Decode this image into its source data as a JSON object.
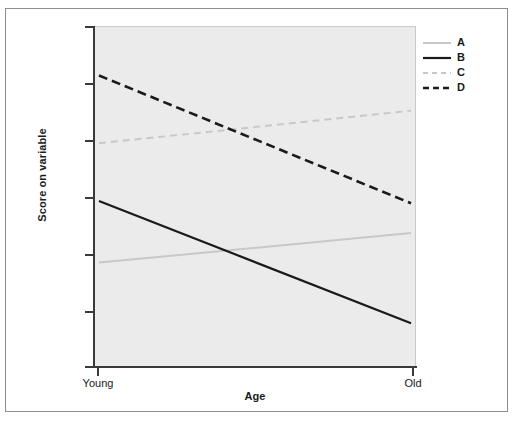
{
  "chart_data": {
    "type": "line",
    "title": "",
    "xlabel": "Age",
    "ylabel": "Score on variable",
    "x": [
      "Young",
      "Old"
    ],
    "xtick_labels": [
      "Young",
      "Old"
    ],
    "ytick_labels": [
      "",
      "",
      "",
      "",
      "",
      "",
      ""
    ],
    "grid": false,
    "legend_position": "top-right",
    "xlim": [
      0,
      1
    ],
    "ylim": [
      0,
      1
    ],
    "y_tick_count": 7,
    "series": [
      {
        "name": "A",
        "style": "solid",
        "color": "#c8c8c8",
        "width": 2,
        "values": [
          0.305,
          0.392
        ],
        "trend": "slight increase"
      },
      {
        "name": "B",
        "style": "solid",
        "color": "#1a1a1a",
        "width": 2.2,
        "values": [
          0.487,
          0.126
        ],
        "trend": "strong decrease"
      },
      {
        "name": "C",
        "style": "dashed",
        "color": "#c8c8c8",
        "width": 2,
        "values": [
          0.657,
          0.753
        ],
        "trend": "slight increase"
      },
      {
        "name": "D",
        "style": "dashed",
        "color": "#1a1a1a",
        "width": 2.6,
        "values": [
          0.857,
          0.48
        ],
        "trend": "strong decrease"
      }
    ]
  },
  "legend": {
    "items": [
      {
        "label": "A"
      },
      {
        "label": "B"
      },
      {
        "label": "C"
      },
      {
        "label": "D"
      }
    ]
  },
  "axes": {
    "x_title": "Age",
    "y_title": "Score on variable",
    "x_tick_labels": [
      "Young",
      "Old"
    ]
  },
  "colors": {
    "plot_background": "#ebebeb",
    "figure_background": "#ffffff",
    "axis": "#3a3a3a",
    "series_dark": "#1a1a1a",
    "series_light": "#c8c8c8",
    "frame_border": "#8d8d8d"
  }
}
